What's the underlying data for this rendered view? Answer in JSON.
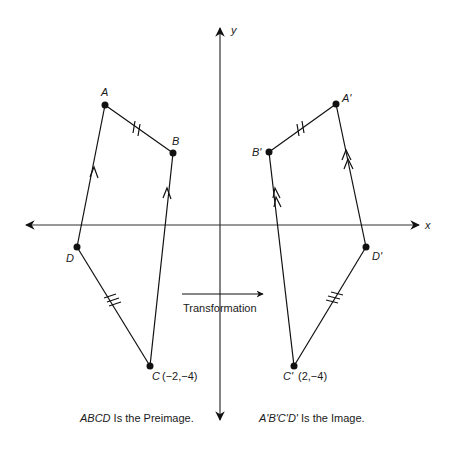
{
  "axes": {
    "x_label": "x",
    "y_label": "y"
  },
  "preimage": {
    "name": "ABCD",
    "vertices": [
      {
        "label": "A",
        "px": [
          105,
          105
        ]
      },
      {
        "label": "B",
        "px": [
          173,
          153
        ]
      },
      {
        "label": "C",
        "px": [
          150,
          366
        ],
        "coords": "(−2,−4)"
      },
      {
        "label": "D",
        "px": [
          77,
          247
        ]
      }
    ],
    "caption_name": "ABCD",
    "caption_rest": " Is the Preimage."
  },
  "image": {
    "name": "A'B'C'D'",
    "vertices": [
      {
        "label": "A'",
        "px": [
          336,
          104
        ]
      },
      {
        "label": "B'",
        "px": [
          269,
          152
        ]
      },
      {
        "label": "C'",
        "px": [
          294,
          366
        ],
        "coords": "(2,−4)"
      },
      {
        "label": "D'",
        "px": [
          366,
          247
        ]
      }
    ],
    "caption_name": "A'B'C'D'",
    "caption_rest": " Is the Image."
  },
  "transformation_label": "Transformation",
  "markings": {
    "AB": "double tick",
    "DC": "triple tick",
    "DA_CB": "single arrow (parallel)",
    "A'D'_B'C'": "double arrow (parallel)",
    "A'B'": "double tick",
    "D'C'": "triple tick"
  }
}
